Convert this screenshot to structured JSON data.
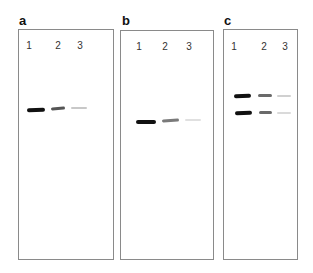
{
  "figure": {
    "panels": [
      {
        "label": "a",
        "lanes": [
          "1",
          "2",
          "3"
        ],
        "bands": [
          {
            "lane": "1",
            "row": 1,
            "intensity": "strong",
            "color": "#111111"
          },
          {
            "lane": "2",
            "row": 1,
            "intensity": "medium",
            "color": "#555555"
          },
          {
            "lane": "3",
            "row": 1,
            "intensity": "faint",
            "color": "#c8c8c8"
          }
        ]
      },
      {
        "label": "b",
        "lanes": [
          "1",
          "2",
          "3"
        ],
        "bands": [
          {
            "lane": "1",
            "row": 1,
            "intensity": "strong",
            "color": "#111111"
          },
          {
            "lane": "2",
            "row": 1,
            "intensity": "medium",
            "color": "#7a7a7a"
          },
          {
            "lane": "3",
            "row": 1,
            "intensity": "faint",
            "color": "#e0e0e0"
          }
        ]
      },
      {
        "label": "c",
        "lanes": [
          "1",
          "2",
          "3"
        ],
        "bands": [
          {
            "lane": "1",
            "row": 1,
            "intensity": "strong",
            "color": "#111111"
          },
          {
            "lane": "2",
            "row": 1,
            "intensity": "medium",
            "color": "#6a6a6a"
          },
          {
            "lane": "3",
            "row": 1,
            "intensity": "faint",
            "color": "#d0d0d0"
          },
          {
            "lane": "1",
            "row": 2,
            "intensity": "strong",
            "color": "#111111"
          },
          {
            "lane": "2",
            "row": 2,
            "intensity": "medium",
            "color": "#6a6a6a"
          },
          {
            "lane": "3",
            "row": 2,
            "intensity": "faint",
            "color": "#dadada"
          }
        ]
      }
    ]
  }
}
